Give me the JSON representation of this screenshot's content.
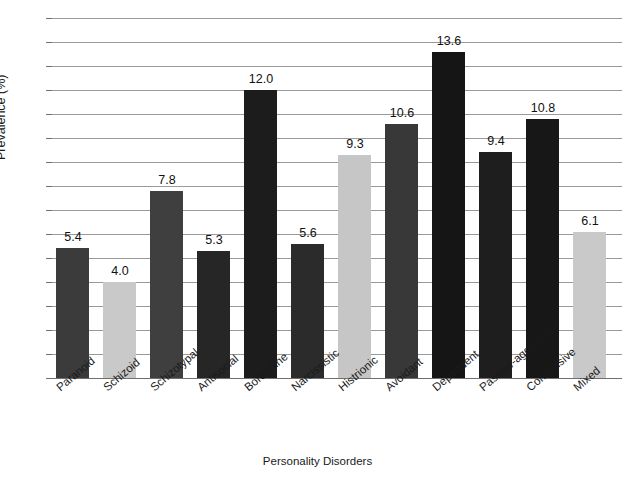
{
  "chart_data": {
    "type": "bar",
    "title": "",
    "xlabel": "Personality Disorders",
    "ylabel": "Prevalence (%)",
    "ylim": [
      0,
      15
    ],
    "ytick_step": 1,
    "yticks": [
      "15",
      "14",
      "13",
      "12",
      "11",
      "10",
      "9",
      "8",
      "7",
      "6",
      "5",
      "4",
      "3",
      "2",
      "1",
      "0"
    ],
    "grid": true,
    "legend": "none",
    "categories": [
      "Paranoid",
      "Schizoid",
      "Schizotypal",
      "Antisocial",
      "Borderline",
      "Narcissistic",
      "Histrionic",
      "Avoidant",
      "Dependent",
      "Passive-aggressive",
      "Compulsive",
      "Mixed"
    ],
    "values": [
      5.4,
      4.0,
      7.8,
      5.3,
      12.0,
      5.6,
      9.3,
      10.6,
      13.6,
      9.4,
      10.8,
      6.1
    ],
    "value_labels": [
      "5.4",
      "4.0",
      "7.8",
      "5.3",
      "12.0",
      "5.6",
      "9.3",
      "10.6",
      "13.6",
      "9.4",
      "10.8",
      "6.1"
    ],
    "bar_colors": [
      "#3b3b3b",
      "#c9c9c9",
      "#3f3f3f",
      "#262626",
      "#1c1c1c",
      "#2b2b2b",
      "#c6c6c6",
      "#383838",
      "#151515",
      "#1e1e1e",
      "#171717",
      "#c9c9c9"
    ],
    "grid_color": "#9a9a9a",
    "axis_color": "#6f6f6f",
    "background": "#ffffff"
  }
}
